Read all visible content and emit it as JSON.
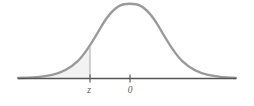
{
  "figure": {
    "name": "standard-normal-distribution-curve",
    "title": "",
    "background_color": "#ffffff",
    "curve_color": "#9a9a9a",
    "axis_color": "#555555",
    "shade_color": "#f2f2f2",
    "marker_line_color": "#b0b0b0",
    "label_color": "#5a5a5a"
  },
  "axis": {
    "name": "horizontal-axis",
    "x_start": 18,
    "x_end": 236,
    "y": 78.5,
    "ticks": [
      {
        "label": "z",
        "x": 90,
        "label_x": 89,
        "label_y": 93
      },
      {
        "label": "0",
        "x": 130,
        "label_x": 130,
        "label_y": 93
      }
    ]
  },
  "marker": {
    "name": "z-vertical-line",
    "x": 90,
    "y_top": 47,
    "y_bottom": 78.5
  },
  "chart_data": {
    "type": "line",
    "xlabel": "",
    "ylabel": "",
    "grid": false,
    "legend": null,
    "xlim": [
      -3.8,
      2.9
    ],
    "ylim": [
      0,
      0.42
    ],
    "annotations": [
      {
        "text": "z",
        "x": -1.15,
        "type": "axis-tick-label"
      },
      {
        "text": "0",
        "x": 0,
        "type": "axis-tick-label"
      }
    ],
    "shaded_region": {
      "label": "area to the left of z",
      "from": -3.8,
      "to": -1.15,
      "fill": "#f2f2f2"
    },
    "series": [
      {
        "name": "standard normal density",
        "x": [
          -3.8,
          -3.4,
          -3.0,
          -2.6,
          -2.2,
          -1.8,
          -1.4,
          -1.15,
          -1.0,
          -0.6,
          -0.2,
          0.0,
          0.2,
          0.6,
          1.0,
          1.4,
          1.8,
          2.2,
          2.6,
          2.9
        ],
        "y": [
          0.0003,
          0.0012,
          0.0044,
          0.0136,
          0.0355,
          0.079,
          0.1497,
          0.2059,
          0.242,
          0.3332,
          0.391,
          0.3989,
          0.391,
          0.3332,
          0.242,
          0.1497,
          0.079,
          0.0355,
          0.0136,
          0.006
        ]
      }
    ]
  }
}
